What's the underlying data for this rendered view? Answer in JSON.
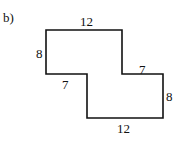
{
  "figure": {
    "part_label": "b)",
    "shape": "rectilinear Z-shaped polygon",
    "stroke_color": "#111111",
    "background": "#ffffff",
    "dimensions": {
      "top": "12",
      "left": "8",
      "inner_left_step": "7",
      "inner_right_step": "7",
      "right": "8",
      "bottom": "12"
    }
  }
}
